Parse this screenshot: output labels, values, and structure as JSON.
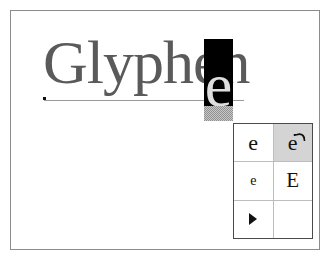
{
  "frame": {
    "border_color": "#8c8c8c",
    "background": "#ffffff"
  },
  "word": {
    "headword": "Glyphen",
    "text_color": "#5a5a5a",
    "baseline_color": "#9a9a9a"
  },
  "selection": {
    "glyph": "e",
    "highlight_color": "#000000",
    "glyph_color": "#dedede",
    "swatch_label": "",
    "swatch_color": "#8f8f8f"
  },
  "glyph_table": {
    "selected_color": "#d4d4d4",
    "border_color": "#4a4a4a",
    "grid_color": "#bdbdbd",
    "rows": [
      {
        "cells": [
          {
            "glyph": "e",
            "kind": "plain",
            "size": "lg",
            "selected": false
          },
          {
            "glyph": "e",
            "kind": "swash",
            "size": "lg",
            "selected": true
          }
        ]
      },
      {
        "cells": [
          {
            "glyph": "e",
            "kind": "plain",
            "size": "sm",
            "selected": false
          },
          {
            "glyph": "E",
            "kind": "plain",
            "size": "cap",
            "selected": false
          }
        ]
      },
      {
        "cells": [
          {
            "glyph": "▶",
            "kind": "arrow",
            "size": "lg",
            "selected": false
          },
          {
            "glyph": "",
            "kind": "empty",
            "size": "lg",
            "selected": false
          }
        ]
      }
    ]
  }
}
